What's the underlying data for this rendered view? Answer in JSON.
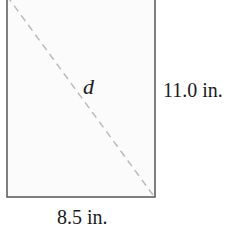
{
  "figure": {
    "type": "rectangle-with-diagonal",
    "diagonal_label": "d",
    "height_label": "11.0 in.",
    "width_label": "8.5 in.",
    "colors": {
      "outline": "#555555",
      "fill": "#fbfbfb",
      "diagonal": "#bbbbbb",
      "text": "#1a1a1a"
    }
  }
}
